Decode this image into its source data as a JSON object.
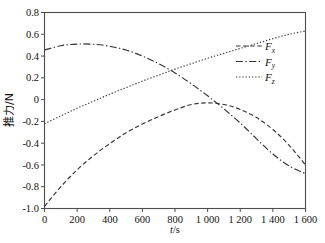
{
  "chart_data": {
    "type": "line",
    "title": "",
    "xlabel": "t/s",
    "ylabel": "推力/N",
    "xlim": [
      0,
      1600
    ],
    "ylim": [
      -1.0,
      0.8
    ],
    "grid": false,
    "legend_position": "upper right",
    "xticks": [
      0,
      200,
      400,
      600,
      800,
      1000,
      1200,
      1400,
      1600
    ],
    "xticklabels": [
      "0",
      "200",
      "400",
      "600",
      "800",
      "1 000",
      "1 200",
      "1 400",
      "1 600"
    ],
    "yticks": [
      -1.0,
      -0.8,
      -0.6,
      -0.4,
      -0.2,
      0,
      0.2,
      0.4,
      0.6,
      0.8
    ],
    "yticklabels": [
      "-1.0",
      "-0.8",
      "-0.6",
      "-0.4",
      "-0.2",
      "0",
      "0.2",
      "0.4",
      "0.6",
      "0.8"
    ],
    "x": [
      0,
      100,
      200,
      300,
      400,
      500,
      600,
      700,
      800,
      900,
      1000,
      1100,
      1200,
      1300,
      1400,
      1500,
      1600
    ],
    "series": [
      {
        "name": "Fx",
        "label": "F",
        "sublabel": "x",
        "style": "dashed",
        "color": "#33333a",
        "values": [
          -0.98,
          -0.8,
          -0.645,
          -0.515,
          -0.405,
          -0.305,
          -0.225,
          -0.155,
          -0.095,
          -0.045,
          -0.03,
          -0.045,
          -0.09,
          -0.165,
          -0.275,
          -0.42,
          -0.6
        ]
      },
      {
        "name": "Fy",
        "label": "F",
        "sublabel": "y",
        "style": "dashdot",
        "color": "#33333a",
        "values": [
          0.455,
          0.495,
          0.51,
          0.508,
          0.49,
          0.455,
          0.4,
          0.33,
          0.245,
          0.145,
          0.035,
          -0.085,
          -0.215,
          -0.36,
          -0.5,
          -0.61,
          -0.68
        ]
      },
      {
        "name": "Fz",
        "label": "F",
        "sublabel": "z",
        "style": "dotted",
        "color": "#33333a",
        "values": [
          -0.22,
          -0.15,
          -0.08,
          -0.015,
          0.05,
          0.11,
          0.17,
          0.225,
          0.28,
          0.33,
          0.38,
          0.425,
          0.47,
          0.515,
          0.56,
          0.6,
          0.63
        ]
      }
    ]
  },
  "axis": {
    "x_title_var": "t",
    "x_title_unit": "/s",
    "y_title": "推力/N"
  },
  "legend": {
    "entries": [
      {
        "label": "F",
        "sub": "x"
      },
      {
        "label": "F",
        "sub": "y"
      },
      {
        "label": "F",
        "sub": "z"
      }
    ]
  },
  "colors": {
    "line": "#33333a",
    "axis": "#4d4d4d",
    "background": "#ffffff",
    "text": "#111111"
  }
}
